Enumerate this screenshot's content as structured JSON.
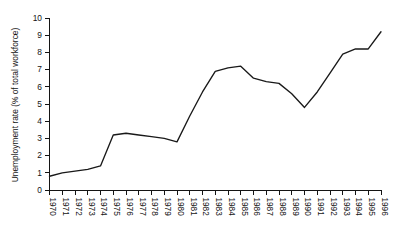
{
  "chart_data": {
    "type": "line",
    "title": "",
    "xlabel": "",
    "ylabel": "Unemployment rate (% of total workforce)",
    "ylim": [
      0,
      10
    ],
    "xlim": [
      1970,
      1996
    ],
    "grid": false,
    "legend": null,
    "y_ticks": [
      0,
      1,
      2,
      3,
      4,
      5,
      6,
      7,
      8,
      9,
      10
    ],
    "y_tick_labels": [
      "0",
      "1",
      "2",
      "3",
      "4",
      "5",
      "6",
      "7",
      "8",
      "9",
      "10"
    ],
    "categories": [
      "1970",
      "1971",
      "1972",
      "1973",
      "1974",
      "1975",
      "1976",
      "1977",
      "1978",
      "1979",
      "1980",
      "1981",
      "1982",
      "1983",
      "1984",
      "1985",
      "1986",
      "1987",
      "1988",
      "1989",
      "1990",
      "1991",
      "1992",
      "1993",
      "1994",
      "1995",
      "1996"
    ],
    "x": [
      1970,
      1971,
      1972,
      1973,
      1974,
      1975,
      1976,
      1977,
      1978,
      1979,
      1980,
      1981,
      1982,
      1983,
      1984,
      1985,
      1986,
      1987,
      1988,
      1989,
      1990,
      1991,
      1992,
      1993,
      1994,
      1995,
      1996
    ],
    "values": [
      0.8,
      1.0,
      1.1,
      1.2,
      1.4,
      3.2,
      3.3,
      3.2,
      3.1,
      3.0,
      2.8,
      4.3,
      5.7,
      6.9,
      7.1,
      7.2,
      6.5,
      6.3,
      6.2,
      5.6,
      4.8,
      5.7,
      6.8,
      7.9,
      8.2,
      8.2,
      9.2
    ],
    "series": [
      {
        "name": "Unemployment rate",
        "color": "#191919",
        "values": [
          0.8,
          1.0,
          1.1,
          1.2,
          1.4,
          3.2,
          3.3,
          3.2,
          3.1,
          3.0,
          2.8,
          4.3,
          5.7,
          6.9,
          7.1,
          7.2,
          6.5,
          6.3,
          6.2,
          5.6,
          4.8,
          5.7,
          6.8,
          7.9,
          8.2,
          8.2,
          9.2
        ]
      }
    ]
  }
}
